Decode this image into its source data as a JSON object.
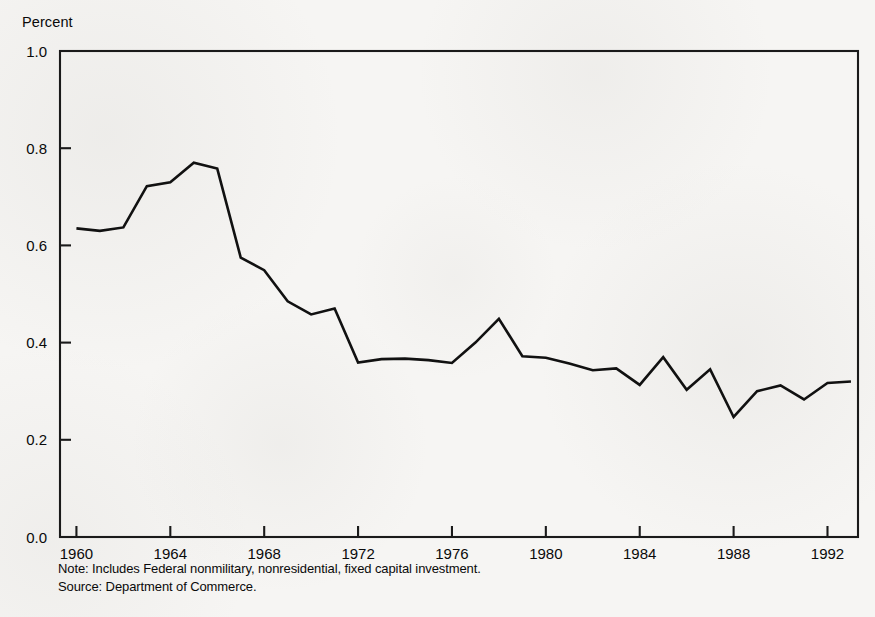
{
  "chart_data": {
    "type": "line",
    "title": "",
    "ylabel": "Percent",
    "xlabel": "",
    "ylim": [
      0.0,
      1.0
    ],
    "xlim": [
      1959.3,
      1993.3
    ],
    "grid": false,
    "legend": null,
    "yticks": [
      "0.0",
      "0.2",
      "0.4",
      "0.6",
      "0.8",
      "1.0"
    ],
    "ytick_values": [
      0.0,
      0.2,
      0.4,
      0.6,
      0.8,
      1.0
    ],
    "xticks": [
      "1960",
      "1964",
      "1968",
      "1972",
      "1976",
      "1980",
      "1984",
      "1988",
      "1992"
    ],
    "xtick_values": [
      1960,
      1964,
      1968,
      1972,
      1976,
      1980,
      1984,
      1988,
      1992
    ],
    "series": [
      {
        "name": "Federal nonmilitary, nonresidential, fixed capital investment",
        "color": "#111111",
        "x": [
          1960,
          1961,
          1962,
          1963,
          1964,
          1965,
          1966,
          1967,
          1968,
          1969,
          1970,
          1971,
          1972,
          1973,
          1974,
          1975,
          1976,
          1977,
          1978,
          1979,
          1980,
          1981,
          1982,
          1983,
          1984,
          1985,
          1986,
          1987,
          1988,
          1989,
          1990,
          1991,
          1992,
          1993
        ],
        "values": [
          0.635,
          0.63,
          0.637,
          0.722,
          0.73,
          0.77,
          0.758,
          0.575,
          0.549,
          0.485,
          0.458,
          0.47,
          0.359,
          0.366,
          0.367,
          0.364,
          0.358,
          0.4,
          0.449,
          0.372,
          0.369,
          0.357,
          0.343,
          0.347,
          0.313,
          0.37,
          0.303,
          0.345,
          0.247,
          0.3,
          0.312,
          0.283,
          0.317,
          0.32
        ]
      }
    ],
    "notes": [
      "Note: Includes Federal nonmilitary, nonresidential, fixed capital investment.",
      "Source: Department of Commerce."
    ]
  },
  "geometry": {
    "plot_left": 60,
    "plot_right": 858,
    "plot_top": 51,
    "plot_bottom": 537
  },
  "colors": {
    "line": "#111111",
    "axis": "#1a1a1a",
    "background": "#f6f5f3",
    "text": "#0a0a0a"
  }
}
